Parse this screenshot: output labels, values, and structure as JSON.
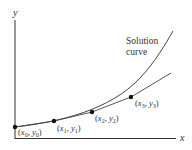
{
  "diagram": {
    "axes": {
      "x_label": "x",
      "y_label": "y"
    },
    "curve_label": {
      "line1": "Solution",
      "line2": "curve"
    },
    "points": [
      {
        "label": "(x0, y0)",
        "x": "x",
        "xs": "0",
        "y": "y",
        "ys": "0"
      },
      {
        "label": "(x1, y1)",
        "x": "x",
        "xs": "1",
        "y": "y",
        "ys": "1"
      },
      {
        "label": "(x2, y2)",
        "x": "x",
        "xs": "2",
        "y": "y",
        "ys": "2"
      },
      {
        "label": "(x3, y3)",
        "x": "x",
        "xs": "3",
        "y": "y",
        "ys": "3"
      }
    ],
    "colors": {
      "axis": "#333333",
      "curve": "#444444",
      "point": "#111111",
      "text": "#333333"
    }
  }
}
